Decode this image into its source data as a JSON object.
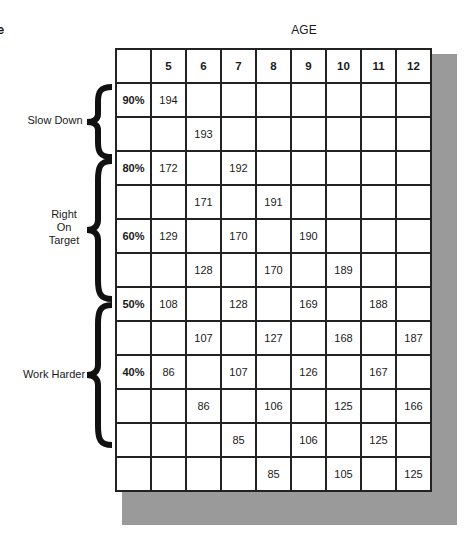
{
  "corner_text": "e",
  "header": {
    "axis_label": "AGE",
    "ages": [
      "5",
      "6",
      "7",
      "8",
      "9",
      "10",
      "11",
      "12"
    ]
  },
  "zones": [
    {
      "label": "Slow Down"
    },
    {
      "label": "Right\nOn\nTarget",
      "lines": [
        "Right",
        "On",
        "Target"
      ]
    },
    {
      "label": "Work Harder"
    }
  ],
  "rows": [
    [
      "90%",
      "194",
      "",
      "",
      "",
      "",
      "",
      "",
      ""
    ],
    [
      "",
      "",
      "193",
      "",
      "",
      "",
      "",
      "",
      ""
    ],
    [
      "80%",
      "172",
      "",
      "192",
      "",
      "",
      "",
      "",
      ""
    ],
    [
      "",
      "",
      "171",
      "",
      "191",
      "",
      "",
      "",
      ""
    ],
    [
      "60%",
      "129",
      "",
      "170",
      "",
      "190",
      "",
      "",
      ""
    ],
    [
      "",
      "",
      "128",
      "",
      "170",
      "",
      "189",
      "",
      ""
    ],
    [
      "50%",
      "108",
      "",
      "128",
      "",
      "169",
      "",
      "188",
      ""
    ],
    [
      "",
      "",
      "107",
      "",
      "127",
      "",
      "168",
      "",
      "187"
    ],
    [
      "40%",
      "86",
      "",
      "107",
      "",
      "126",
      "",
      "167",
      ""
    ],
    [
      "",
      "",
      "86",
      "",
      "106",
      "",
      "125",
      "",
      "166"
    ],
    [
      "",
      "",
      "",
      "85",
      "",
      "106",
      "",
      "125",
      ""
    ],
    [
      "",
      "",
      "",
      "",
      "85",
      "",
      "105",
      "",
      "125"
    ]
  ]
}
